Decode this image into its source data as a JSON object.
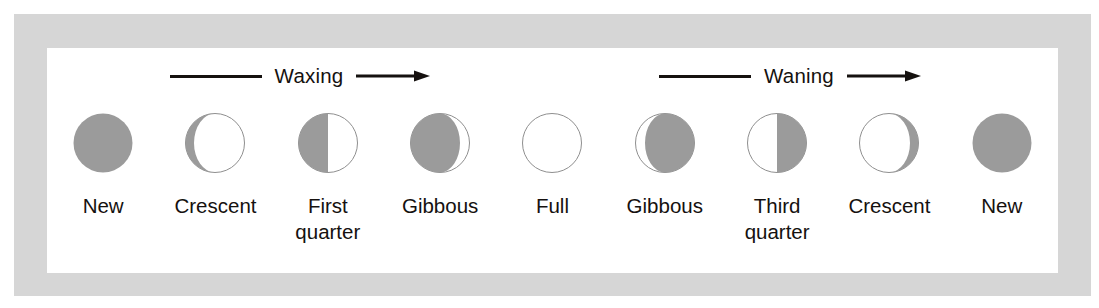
{
  "figure": {
    "frame_color": "#d6d6d6",
    "panel_color": "#ffffff",
    "ink_color": "#15110f",
    "shadow_color": "#9b9b9b",
    "outline_color": "#8f8f8f"
  },
  "annotations": [
    {
      "label": "Waxing",
      "direction": "right",
      "icon": "arrow-right-icon"
    },
    {
      "label": "Waning",
      "direction": "right",
      "icon": "arrow-right-icon"
    }
  ],
  "phases": [
    {
      "label_line1": "New",
      "label_line2": "",
      "icon": "moon-new-icon",
      "illumination": 0.0,
      "lit_side": "none",
      "shape": "full-dark"
    },
    {
      "label_line1": "Crescent",
      "label_line2": "",
      "icon": "moon-waxing-crescent-icon",
      "illumination": 0.18,
      "lit_side": "right",
      "shape": "crescent-right"
    },
    {
      "label_line1": "First",
      "label_line2": "quarter",
      "icon": "moon-first-quarter-icon",
      "illumination": 0.5,
      "lit_side": "right",
      "shape": "half-right"
    },
    {
      "label_line1": "Gibbous",
      "label_line2": "",
      "icon": "moon-waxing-gibbous-icon",
      "illumination": 0.82,
      "lit_side": "right",
      "shape": "gibbous-right"
    },
    {
      "label_line1": "Full",
      "label_line2": "",
      "icon": "moon-full-icon",
      "illumination": 1.0,
      "lit_side": "both",
      "shape": "full-light"
    },
    {
      "label_line1": "Gibbous",
      "label_line2": "",
      "icon": "moon-waning-gibbous-icon",
      "illumination": 0.82,
      "lit_side": "left",
      "shape": "gibbous-left"
    },
    {
      "label_line1": "Third",
      "label_line2": "quarter",
      "icon": "moon-third-quarter-icon",
      "illumination": 0.5,
      "lit_side": "left",
      "shape": "half-left"
    },
    {
      "label_line1": "Crescent",
      "label_line2": "",
      "icon": "moon-waning-crescent-icon",
      "illumination": 0.18,
      "lit_side": "left",
      "shape": "crescent-left"
    },
    {
      "label_line1": "New",
      "label_line2": "",
      "icon": "moon-new-icon",
      "illumination": 0.0,
      "lit_side": "none",
      "shape": "full-dark"
    }
  ]
}
